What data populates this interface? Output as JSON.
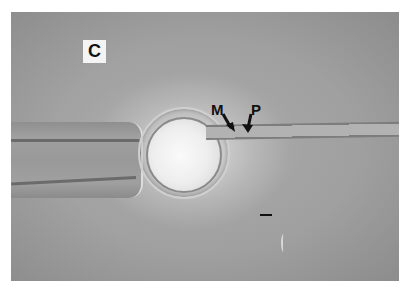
{
  "figure": {
    "panel_label": "C",
    "annotations": [
      {
        "label": "M",
        "meaning": "arrow marker"
      },
      {
        "label": "P",
        "meaning": "arrow marker"
      }
    ],
    "scale_bar": true
  }
}
